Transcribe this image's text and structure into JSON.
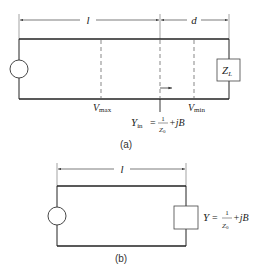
{
  "figure_a": {
    "caption": "(a)",
    "dimension_l": "l",
    "dimension_d": "d",
    "load_label_main": "Z",
    "load_label_sub": "L",
    "vmax_main": "V",
    "vmax_sub": "max",
    "vmin_main": "V",
    "vmin_sub": "min",
    "yin_main": "Y",
    "yin_sub": "in",
    "yin_equals": "=",
    "yin_num": "1",
    "yin_den_main": "Z",
    "yin_den_sub": "0",
    "yin_tail": "+jB"
  },
  "figure_b": {
    "caption": "(b)",
    "dimension_l": "l",
    "y_main": "Y",
    "y_equals": "=",
    "y_num": "1",
    "y_den_main": "Z",
    "y_den_sub": "0",
    "y_tail": "+jB"
  },
  "colors": {
    "line": "#222222",
    "dash": "#555555"
  }
}
